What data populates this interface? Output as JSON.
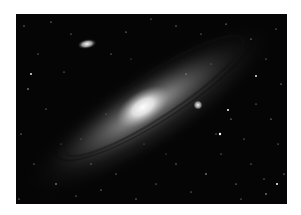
{
  "image": {
    "subject": "Andromeda Galaxy (spiral galaxy) with satellite galaxies",
    "alt": "Black-and-white astrophotograph of a large spiral galaxy seen at an angle, with a bright core and a smaller elliptical satellite galaxy above-left",
    "colors": {
      "background": "#ffffff",
      "sky": "#050505",
      "core": "#f4f4f4",
      "disk": "#9a9a9a",
      "stars": "#dddddd"
    }
  }
}
